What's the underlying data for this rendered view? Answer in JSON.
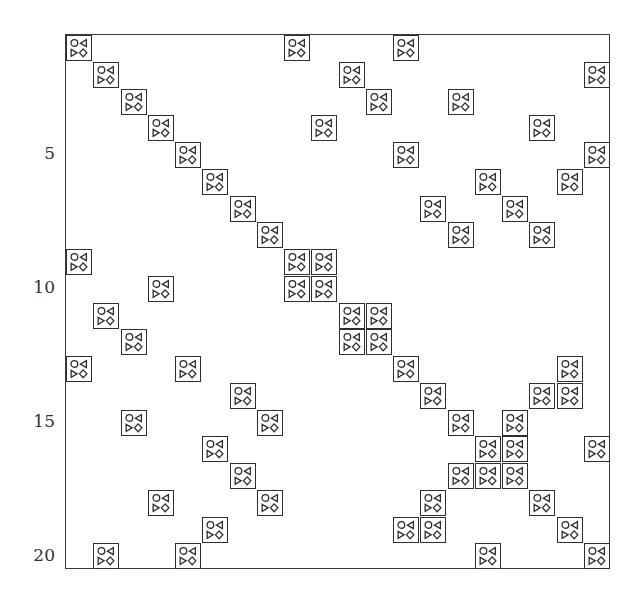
{
  "chart_data": {
    "type": "heatmap",
    "title": "",
    "xlabel": "",
    "ylabel": "",
    "grid": false,
    "n_rows": 20,
    "n_cols": 20,
    "y_ticks": [
      5,
      10,
      15,
      20
    ],
    "y_tick_labels": [
      "5",
      "10",
      "15",
      "20"
    ],
    "x_ticks": [],
    "marker": "square-with-circle-triangles-diamond glyph",
    "filled_cells": [
      {
        "row": 1,
        "cols": [
          1,
          9,
          13
        ]
      },
      {
        "row": 2,
        "cols": [
          2,
          11,
          20
        ]
      },
      {
        "row": 3,
        "cols": [
          3,
          12,
          15
        ]
      },
      {
        "row": 4,
        "cols": [
          4,
          10,
          18
        ]
      },
      {
        "row": 5,
        "cols": [
          5,
          13,
          20
        ]
      },
      {
        "row": 6,
        "cols": [
          6,
          16,
          19
        ]
      },
      {
        "row": 7,
        "cols": [
          7,
          14,
          17
        ]
      },
      {
        "row": 8,
        "cols": [
          8,
          15,
          18
        ]
      },
      {
        "row": 9,
        "cols": [
          1,
          9,
          10
        ]
      },
      {
        "row": 10,
        "cols": [
          4,
          9,
          10
        ]
      },
      {
        "row": 11,
        "cols": [
          2,
          11,
          12
        ]
      },
      {
        "row": 12,
        "cols": [
          3,
          11,
          12
        ]
      },
      {
        "row": 13,
        "cols": [
          1,
          5,
          13,
          19
        ]
      },
      {
        "row": 14,
        "cols": [
          7,
          14,
          18,
          19
        ]
      },
      {
        "row": 15,
        "cols": [
          3,
          8,
          15,
          17
        ]
      },
      {
        "row": 16,
        "cols": [
          6,
          16,
          17,
          20
        ]
      },
      {
        "row": 17,
        "cols": [
          7,
          15,
          16,
          17
        ]
      },
      {
        "row": 18,
        "cols": [
          4,
          8,
          14,
          18
        ]
      },
      {
        "row": 19,
        "cols": [
          6,
          13,
          14,
          19
        ]
      },
      {
        "row": 20,
        "cols": [
          2,
          5,
          16,
          20
        ]
      }
    ]
  },
  "axis": {
    "y_labels": [
      {
        "text": "5",
        "row": 5
      },
      {
        "text": "10",
        "row": 10
      },
      {
        "text": "15",
        "row": 15
      },
      {
        "text": "20",
        "row": 20
      }
    ]
  },
  "colors": {
    "stroke": "#2e2e2e",
    "background": "#ffffff"
  }
}
